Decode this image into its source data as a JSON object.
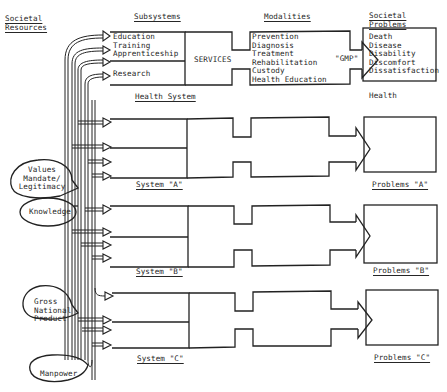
{
  "headers": {
    "resources": [
      "Societal",
      "Resources"
    ],
    "subsystems": "Subsystems",
    "modalities": "Modalities",
    "problems": [
      "Societal",
      "Problems"
    ]
  },
  "health_system": {
    "subsystems": [
      "Education",
      "Training",
      "Apprenticeship",
      "Research"
    ],
    "services": "SERVICES",
    "modalities": [
      "Prevention",
      "Diagnosis",
      "Treatment",
      "Rehabilitation",
      "Custody",
      "Health Education"
    ],
    "output_label": "\"GMP\"",
    "problems": [
      "Death",
      "Disease",
      "Disability",
      "Discomfort",
      "Dissatisfaction"
    ],
    "system_label": "Health System",
    "outcome_label": "Health"
  },
  "resources": [
    {
      "label": [
        "Values",
        "Mandate/",
        "Legitimacy"
      ]
    },
    {
      "label": [
        "Knowledge"
      ]
    },
    {
      "label": [
        "Gross",
        "National",
        "Product"
      ]
    },
    {
      "label": [
        "Manpower"
      ]
    }
  ],
  "systems": [
    {
      "label": "System \"A\"",
      "problems_label": "Problems \"A\""
    },
    {
      "label": "System \"B\"",
      "problems_label": "Problems \"B\""
    },
    {
      "label": "System \"C\"",
      "problems_label": "Problems \"C\""
    }
  ],
  "colors": {
    "line": "#222222",
    "background": "#ffffff"
  }
}
